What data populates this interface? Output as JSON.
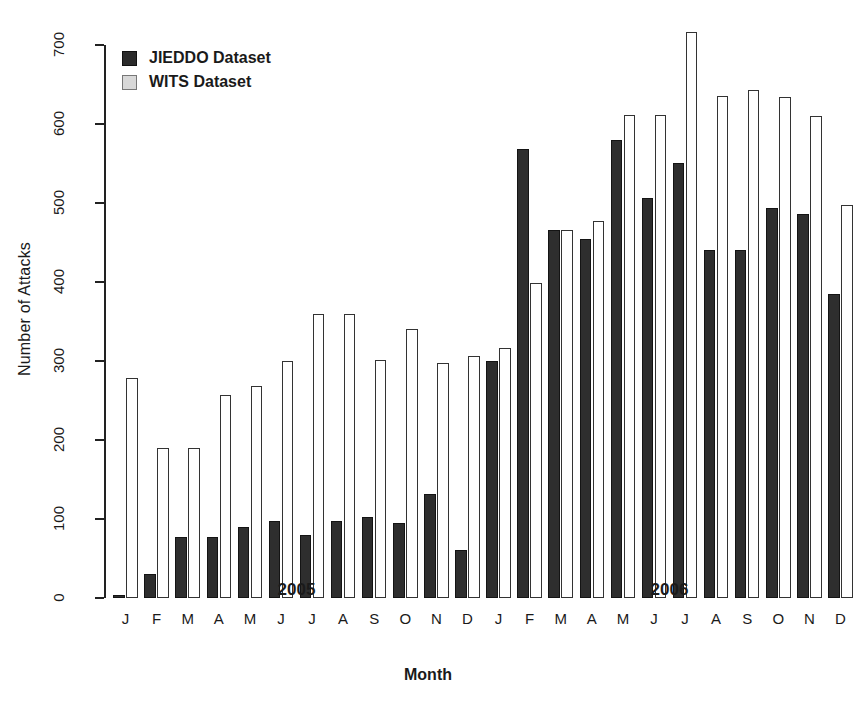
{
  "chart_data": {
    "type": "bar",
    "title": "",
    "xlabel": "Month",
    "ylabel": "Number of Attacks",
    "ylim": [
      0,
      700
    ],
    "yticks": [
      0,
      100,
      200,
      300,
      400,
      500,
      600,
      700
    ],
    "grid": false,
    "legend_position": "top-left",
    "categories": [
      "J",
      "F",
      "M",
      "A",
      "M",
      "J",
      "J",
      "A",
      "S",
      "O",
      "N",
      "D",
      "J",
      "F",
      "M",
      "A",
      "M",
      "J",
      "J",
      "A",
      "S",
      "O",
      "N",
      "D"
    ],
    "group_labels": [
      "2005",
      "2006"
    ],
    "group_spans": [
      12,
      12
    ],
    "series": [
      {
        "name": "JIEDDO Dataset",
        "color": "#2e2e2e",
        "values": [
          4,
          30,
          77,
          77,
          90,
          98,
          80,
          98,
          102,
          95,
          132,
          61,
          300,
          568,
          466,
          455,
          580,
          506,
          551,
          441,
          441,
          494,
          486,
          385
        ]
      },
      {
        "name": "WITS Dataset",
        "color": "#ffffff",
        "values": [
          279,
          190,
          190,
          257,
          269,
          300,
          359,
          359,
          301,
          340,
          297,
          306,
          317,
          399,
          466,
          477,
          612,
          612,
          717,
          636,
          643,
          634,
          610,
          497
        ]
      }
    ]
  },
  "legend": {
    "items": [
      {
        "label": "JIEDDO Dataset",
        "swatch": "dark"
      },
      {
        "label": "WITS Dataset",
        "swatch": "light"
      }
    ]
  },
  "axes": {
    "y_label": "Number of Attacks",
    "x_label": "Month",
    "y_tick_labels": [
      "0",
      "100",
      "200",
      "300",
      "400",
      "500",
      "600",
      "700"
    ],
    "month_letters": [
      "J",
      "F",
      "M",
      "A",
      "M",
      "J",
      "J",
      "A",
      "S",
      "O",
      "N",
      "D",
      "J",
      "F",
      "M",
      "A",
      "M",
      "J",
      "J",
      "A",
      "S",
      "O",
      "N",
      "D"
    ],
    "year_labels": [
      "2005",
      "2006"
    ]
  }
}
